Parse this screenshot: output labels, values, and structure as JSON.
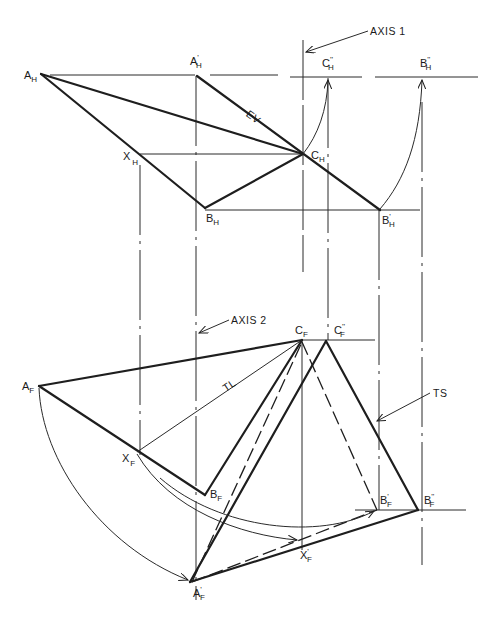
{
  "figure": {
    "type": "descriptive geometry construction — true size of plane by double rotation",
    "callouts": {
      "axis1": "AXIS 1",
      "axis2": "AXIS 2",
      "true_shape": "TS",
      "edge_view": "EV",
      "true_length": "TL"
    },
    "top_view_points": {
      "A_H": {
        "base": "A",
        "sub": "H",
        "prime": ""
      },
      "A1_H": {
        "base": "A",
        "sub": "H",
        "prime": "'"
      },
      "C2_H": {
        "base": "C",
        "sub": "H",
        "prime": "''"
      },
      "B2_H": {
        "base": "B",
        "sub": "H",
        "prime": "''"
      },
      "X_H": {
        "base": "X",
        "sub": "H",
        "prime": ""
      },
      "C_H": {
        "base": "C",
        "sub": "H",
        "prime": ""
      },
      "B_H": {
        "base": "B",
        "sub": "H",
        "prime": ""
      },
      "B1_H": {
        "base": "B",
        "sub": "H",
        "prime": "'"
      }
    },
    "front_view_points": {
      "C_F": {
        "base": "C",
        "sub": "F",
        "prime": ""
      },
      "C2_F": {
        "base": "C",
        "sub": "F",
        "prime": "''"
      },
      "A_F": {
        "base": "A",
        "sub": "F",
        "prime": ""
      },
      "X_F": {
        "base": "X",
        "sub": "F",
        "prime": ""
      },
      "B_F": {
        "base": "B",
        "sub": "F",
        "prime": ""
      },
      "B1_F": {
        "base": "B",
        "sub": "F",
        "prime": "'"
      },
      "B2_F": {
        "base": "B",
        "sub": "F",
        "prime": "''"
      },
      "X1_F": {
        "base": "X",
        "sub": "F",
        "prime": "'"
      },
      "A1_F": {
        "base": "A",
        "sub": "F",
        "prime": "'"
      }
    },
    "colors": {
      "ink": "#1e1e1e",
      "paper": "#ffffff"
    }
  }
}
